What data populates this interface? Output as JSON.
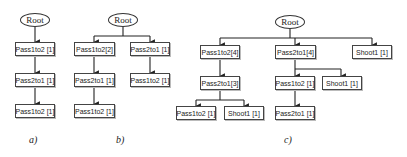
{
  "diagram": {
    "a": {
      "caption": "a)",
      "root": "Root",
      "nodes": [
        "Pass1to2 [1]",
        "Pass2to1 [1]",
        "Pass1to2 [1]"
      ]
    },
    "b": {
      "caption": "b)",
      "root": "Root",
      "left": [
        "Pass1to2[2]",
        "Pass2to1 [1]",
        "Pass1to2 [1]"
      ],
      "right": [
        "Pass2to1 [1]",
        "Pass1to2 [1]"
      ]
    },
    "c": {
      "caption": "c)",
      "root": "Root",
      "left": {
        "top": "Pass1to2[4]",
        "mid": "Pass2to1[3]",
        "children": [
          "Pass1to2 [1]",
          "Shoot1 [1]"
        ]
      },
      "middle": {
        "top": "Pass2to1[4]",
        "children": [
          "Pass1to2 [1]",
          "Shoot1 [1]"
        ],
        "grandchild": "Pass2to1 [1]"
      },
      "right": {
        "top": "Shoot1 [1]"
      }
    }
  }
}
